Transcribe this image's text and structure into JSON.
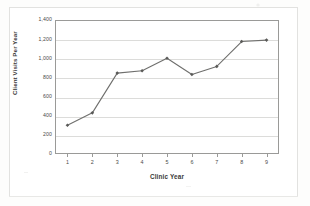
{
  "chart_data": {
    "type": "line",
    "title": "",
    "xlabel": "Clinic Year",
    "ylabel": "Client Visits Per Year",
    "x": [
      1,
      2,
      3,
      4,
      5,
      6,
      7,
      8,
      9
    ],
    "xtick_labels": [
      "1",
      "2",
      "3",
      "4",
      "5",
      "6",
      "7",
      "8",
      "9"
    ],
    "values": [
      300,
      430,
      845,
      870,
      1000,
      830,
      915,
      1175,
      1190
    ],
    "ytick_labels": [
      "1,400",
      "1,200",
      "1,000",
      "800",
      "600",
      "400",
      "200",
      "0"
    ],
    "ytick_values": [
      1400,
      1200,
      1000,
      800,
      600,
      400,
      200,
      0
    ],
    "ylim": [
      0,
      1400
    ],
    "xlim": [
      0.5,
      9.5
    ],
    "grid": true,
    "legend": false,
    "legend_position": "none",
    "series": [
      {
        "name": "Client Visits Per Year",
        "values": [
          300,
          430,
          845,
          870,
          1000,
          830,
          915,
          1175,
          1190
        ],
        "line_color": "#6f6f6d",
        "marker_color": "#5a5a58",
        "marker": "diamond"
      }
    ]
  },
  "style": {
    "line_color": "#6f6f6d",
    "marker_color": "#5a5a58",
    "grid_color": "#dcdcda",
    "axis_color": "#9a9a98",
    "text_color": "#3a3a38",
    "background": "#ffffff",
    "frame_color": "#e2e2e0"
  }
}
